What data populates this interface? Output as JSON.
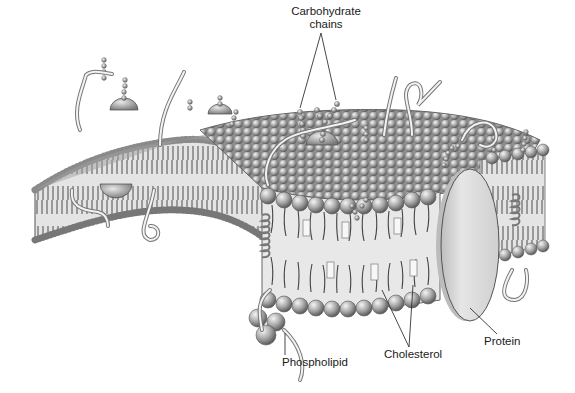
{
  "diagram": {
    "labels": {
      "carbohydrate_line1": "Carbohydrate",
      "carbohydrate_line2": "chains",
      "phospholipid": "Phospholipid",
      "cholesterol": "Cholesterol",
      "protein": "Protein"
    },
    "colors": {
      "background": "#ffffff",
      "head": "#a9a9a9",
      "head_dark": "#6e6e6e",
      "tail": "#4a4a4a",
      "core": "#e6e6e6",
      "protein": "#dcdcdc",
      "line": "#333333"
    }
  }
}
